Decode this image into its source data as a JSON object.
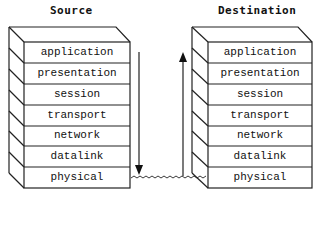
{
  "source": {
    "title": "Source",
    "layers": [
      "application",
      "presentation",
      "session",
      "transport",
      "network",
      "datalink",
      "physical"
    ]
  },
  "destination": {
    "title": "Destination",
    "layers": [
      "application",
      "presentation",
      "session",
      "transport",
      "network",
      "datalink",
      "physical"
    ]
  },
  "arrows": {
    "source_direction": "down",
    "destination_direction": "up",
    "link": "wavy-physical-medium"
  },
  "colors": {
    "line": "#222222",
    "background": "#ffffff"
  }
}
